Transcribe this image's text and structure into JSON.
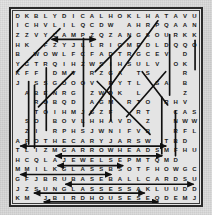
{
  "puzzle": {
    "title": "Word Search",
    "rows": 20,
    "cols": 20,
    "frame_color": "#2a2a2a",
    "paper_color": "#dcdcdc",
    "grid_background": "#e4e4e4",
    "letter_color": "#1b1b1b",
    "solution_line_color": "#101010",
    "grid": [
      "DKBLYDICALHOKLHATAVU",
      "ICHVLILQCDWXAHRPQAAN",
      "ZZVYCAMPZQZANGSOURKK",
      "HKXFZYJLLRIGMEDLDQQO",
      "BXWOWLFCFADTRGCEVXDX",
      "YGTRQIHZWSIHSULVXOKX",
      "KFFXDMVXRZGAXTSXXXRX",
      "JXSSGOOOVXRYTLXSAXBX",
      "XABENRGXZWDKXLXXXXZ",
      "XXROBQDXAGMXRTOXRHV",
      "XXTOIHMJGZFXXRTXXCAS",
      "XSOXBOVLHHAVDXZXXNWW",
      "XZIXRPHSJWNIFVBXXRFL",
      "APOTHECARYJARSWXTBD",
      "TLIZMGARROWHEADSMFHU",
      "HCQLAJEWELSEPMTQMDX",
      "MMILKGLASSBSOTFHOWGC",
      "GFJBRUBASEBALLCARDSU",
      "JZSUNGLASSESSAKLUUDD",
      "KMXJBIRDHOUSESEQDEMJ"
    ],
    "solution_words": [
      {
        "word": "CAMP",
        "row": 3,
        "direction": "horizontal"
      },
      {
        "word": "APOTHECARY JARS",
        "row": 14,
        "direction": "horizontal"
      },
      {
        "word": "ARROWHEADS",
        "row": 15,
        "direction": "horizontal"
      },
      {
        "word": "JEWELS",
        "row": 16,
        "direction": "horizontal"
      },
      {
        "word": "MILK GLASS",
        "row": 17,
        "direction": "horizontal"
      },
      {
        "word": "BASEBALL CARDS",
        "row": 18,
        "direction": "horizontal"
      },
      {
        "word": "SUNGLASSES",
        "row": 19,
        "direction": "horizontal"
      },
      {
        "word": "BIRDHOUSES",
        "row": 20,
        "direction": "horizontal"
      }
    ],
    "solution_lines": [
      {
        "name": "diag-up-left-1",
        "x1": 4,
        "y1": 62,
        "x2": 48,
        "y2": 18
      },
      {
        "name": "diag-up-left-2",
        "x1": 26,
        "y1": 98,
        "x2": 62,
        "y2": 62
      },
      {
        "name": "diag-up-left-3",
        "x1": 84,
        "y1": 62,
        "x2": 120,
        "y2": 26
      },
      {
        "name": "diag-up-long",
        "x1": 78,
        "y1": 106,
        "x2": 148,
        "y2": 10
      },
      {
        "name": "diag-down-right",
        "x1": 86,
        "y1": 72,
        "x2": 140,
        "y2": 126
      },
      {
        "name": "diag-up-right",
        "x1": 116,
        "y1": 108,
        "x2": 156,
        "y2": 62
      },
      {
        "name": "diag-down-v",
        "x1": 132,
        "y1": 62,
        "x2": 158,
        "y2": 96
      },
      {
        "name": "vert-1",
        "x1": 16,
        "y1": 72,
        "x2": 16,
        "y2": 136
      },
      {
        "name": "vert-2",
        "x1": 22,
        "y1": 76,
        "x2": 22,
        "y2": 140
      },
      {
        "name": "vert-3",
        "x1": 34,
        "y1": 58,
        "x2": 34,
        "y2": 122
      },
      {
        "name": "vert-4",
        "x1": 72,
        "y1": 28,
        "x2": 72,
        "y2": 118
      },
      {
        "name": "vert-5",
        "x1": 100,
        "y1": 46,
        "x2": 100,
        "y2": 112
      },
      {
        "name": "vert-6",
        "x1": 152,
        "y1": 88,
        "x2": 152,
        "y2": 146
      },
      {
        "name": "vert-7",
        "x1": 160,
        "y1": 24,
        "x2": 160,
        "y2": 86
      },
      {
        "name": "vert-8",
        "x1": 166,
        "y1": 102,
        "x2": 166,
        "y2": 148
      },
      {
        "name": "vert-9",
        "x1": 186,
        "y1": 30,
        "x2": 186,
        "y2": 60
      }
    ],
    "solution_arrows": [
      {
        "name": "arrow-camp",
        "x1": 40,
        "x2": 84,
        "y": 29
      },
      {
        "name": "arrow-apothecary-jars",
        "x1": 8,
        "x2": 156,
        "y": 138
      },
      {
        "name": "arrow-arrowheads",
        "x1": 44,
        "x2": 152,
        "y": 148
      },
      {
        "name": "arrow-jewels",
        "x1": 46,
        "x2": 112,
        "y": 158
      },
      {
        "name": "arrow-milk-glass",
        "x1": 8,
        "x2": 100,
        "y": 167
      },
      {
        "name": "arrow-baseball-cards",
        "x1": 54,
        "x2": 184,
        "y": 177
      },
      {
        "name": "arrow-sunglasses",
        "x1": 22,
        "x2": 134,
        "y": 186
      },
      {
        "name": "arrow-birdhouses",
        "x1": 32,
        "x2": 148,
        "y": 195
      }
    ]
  }
}
